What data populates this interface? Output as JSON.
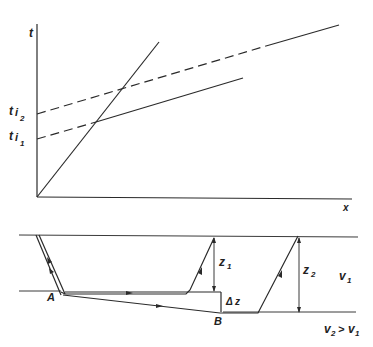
{
  "upper_plot": {
    "y_axis_label": "t",
    "x_axis_label": "x",
    "intercept_labels": [
      {
        "base": "t",
        "sub1": "i",
        "sub2": "2"
      },
      {
        "base": "t",
        "sub1": "i",
        "sub2": "1"
      }
    ],
    "lines": [
      {
        "name": "direct-wave",
        "style": "solid",
        "description": "steep line through origin"
      },
      {
        "name": "refracted-layer-1",
        "style": "dashed-then-solid",
        "intercept": "ti1"
      },
      {
        "name": "refracted-layer-2",
        "style": "dashed-then-solid",
        "intercept": "ti2"
      }
    ]
  },
  "lower_section": {
    "point_labels": {
      "A": "A",
      "B": "B"
    },
    "depth_labels": {
      "z1": "z",
      "z1_sub": "1",
      "z2": "z",
      "z2_sub": "2",
      "dz": "Δ z"
    },
    "velocity_labels": {
      "v1": "v",
      "v1_sub": "1",
      "v2": "v",
      "v2_sub": "2",
      "relation": ">",
      "v2_rhs": "v",
      "v2_rhs_sub": "1"
    }
  }
}
